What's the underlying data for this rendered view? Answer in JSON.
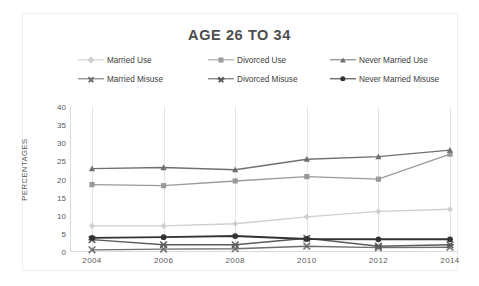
{
  "chart_data": {
    "type": "line",
    "title": "AGE 26 TO 34",
    "xlabel": "",
    "ylabel": "PERCENTAGES",
    "categories": [
      "2004",
      "2006",
      "2008",
      "2010",
      "2012",
      "2014"
    ],
    "x": [
      2004,
      2006,
      2008,
      2010,
      2012,
      2014
    ],
    "ylim": [
      0,
      40
    ],
    "ytick_values": [
      0,
      5,
      10,
      15,
      20,
      25,
      30,
      35,
      40
    ],
    "grid": "vertical-only",
    "legend_position": "top",
    "series": [
      {
        "name": "Married Use",
        "values": [
          7.2,
          7.2,
          7.8,
          9.7,
          11.2,
          11.8
        ],
        "color": "#cfcfcf",
        "marker": "diamond"
      },
      {
        "name": "Divorced Use",
        "values": [
          18.6,
          18.3,
          19.6,
          20.8,
          20.1,
          27.0
        ],
        "color": "#9a9a9a",
        "marker": "square"
      },
      {
        "name": "Never Married Use",
        "values": [
          23.0,
          23.3,
          22.7,
          25.6,
          26.3,
          28.1
        ],
        "color": "#707070",
        "marker": "triangle"
      },
      {
        "name": "Married Misuse",
        "values": [
          0.6,
          0.8,
          0.9,
          1.6,
          1.2,
          1.3
        ],
        "color": "#6e6e6e",
        "marker": "x"
      },
      {
        "name": "Divorced Misuse",
        "values": [
          3.4,
          2.0,
          2.0,
          3.8,
          1.6,
          2.0
        ],
        "color": "#5a5a5a",
        "marker": "x-bar"
      },
      {
        "name": "Never Married Misuse",
        "values": [
          3.9,
          4.1,
          4.4,
          3.6,
          3.5,
          3.5
        ],
        "color": "#333333",
        "marker": "circle"
      }
    ]
  },
  "legend": {
    "rows": [
      [
        {
          "label": "Married Use",
          "color": "#cfcfcf",
          "marker": "diamond"
        },
        {
          "label": "Divorced Use",
          "color": "#9a9a9a",
          "marker": "square"
        },
        {
          "label": "Never Married Use",
          "color": "#707070",
          "marker": "triangle"
        }
      ],
      [
        {
          "label": "Married Misuse",
          "color": "#6e6e6e",
          "marker": "x"
        },
        {
          "label": "Divorced Misuse",
          "color": "#5a5a5a",
          "marker": "x-bar"
        },
        {
          "label": "Never Married Misuse",
          "color": "#333333",
          "marker": "circle"
        }
      ]
    ]
  },
  "axes": {
    "y_label": "PERCENTAGES",
    "y_ticks": [
      "40",
      "35",
      "30",
      "25",
      "20",
      "15",
      "10",
      "5",
      "0"
    ],
    "x_ticks": [
      "2004",
      "2006",
      "2008",
      "2010",
      "2012",
      "2014"
    ]
  }
}
